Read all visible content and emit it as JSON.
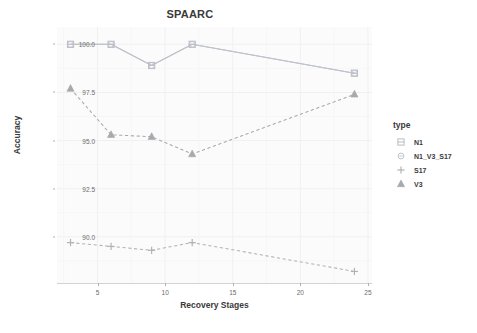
{
  "chart_data": {
    "type": "line",
    "title": "SPAARC",
    "xlabel": "Recovery Stages",
    "ylabel": "Accuracy",
    "xlim": [
      2.0,
      25.3
    ],
    "ylim": [
      87.6,
      100.9
    ],
    "xticks": [
      5,
      10,
      15,
      20,
      25
    ],
    "xtick_labels": [
      "5",
      "10",
      "15",
      "20",
      "25"
    ],
    "yticks": [
      90.0,
      92.5,
      95.0,
      97.5,
      100.0
    ],
    "ytick_labels": [
      "90.0",
      "92.5",
      "95.0",
      "97.5",
      "100.0"
    ],
    "grid": true,
    "legend_title": "type",
    "legend_position": "right",
    "x": [
      3,
      6,
      9,
      12,
      24
    ],
    "series": [
      {
        "name": "N1",
        "marker": "square",
        "linestyle": "solid",
        "color": "#b9bcc4",
        "values": [
          100.0,
          100.0,
          98.9,
          100.0,
          98.5
        ]
      },
      {
        "name": "N1_V3_S17",
        "marker": "circle",
        "linestyle": "solid",
        "color": "#bfc3ca",
        "values": [
          100.0,
          100.0,
          98.9,
          100.0,
          98.5
        ]
      },
      {
        "name": "S17",
        "marker": "plus",
        "linestyle": "dashed",
        "color": "#b2b2b2",
        "values": [
          89.7,
          89.5,
          89.3,
          89.7,
          88.2
        ]
      },
      {
        "name": "V3",
        "marker": "triangle",
        "linestyle": "dashed",
        "color": "#a8a9ad",
        "values": [
          97.7,
          95.3,
          95.2,
          94.3,
          97.4
        ]
      }
    ]
  },
  "legend": {
    "title": "type",
    "items": [
      {
        "label": "N1"
      },
      {
        "label": "N1_V3_S17"
      },
      {
        "label": "S17"
      },
      {
        "label": "V3"
      }
    ]
  },
  "footer": {
    "text": ""
  }
}
